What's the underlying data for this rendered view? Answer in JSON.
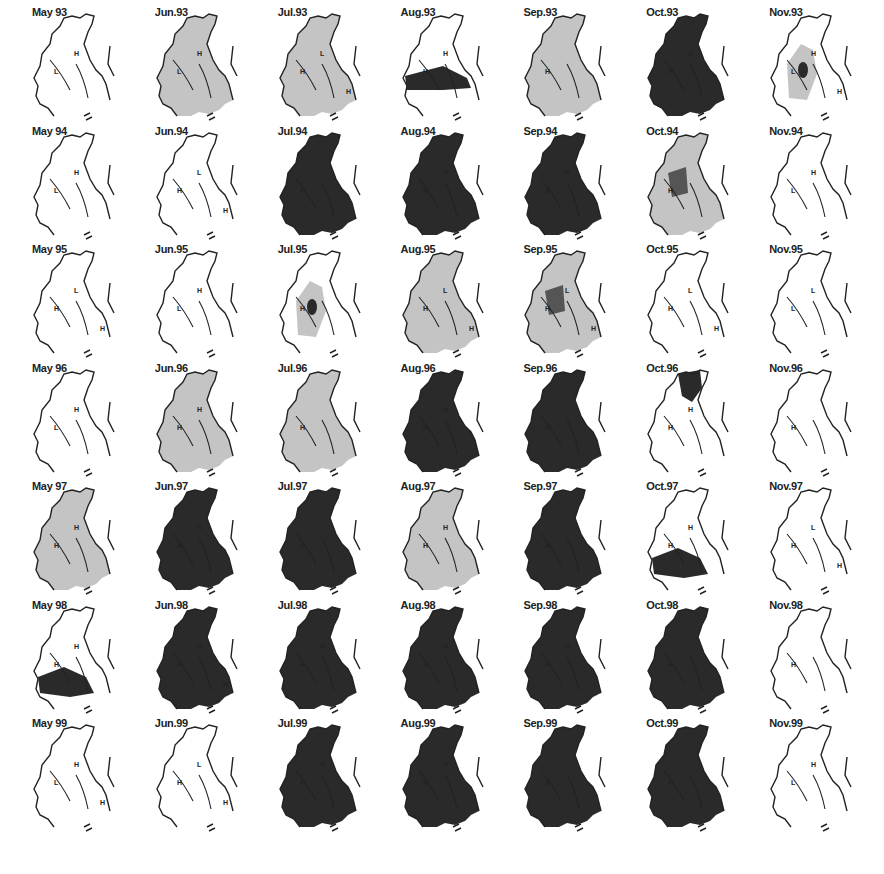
{
  "figure": {
    "rows": [
      "1993",
      "1994",
      "1995",
      "1996",
      "1997",
      "1998",
      "1999"
    ],
    "columns": [
      "May",
      "Jun",
      "Jul",
      "Aug",
      "Sep",
      "Oct",
      "Nov"
    ],
    "shade_colors": {
      "none": "#ffffff",
      "light": "#c4c4c4",
      "medium": "#9a9a9a",
      "dark": "#2a2a2a"
    },
    "panels": [
      {
        "label": "May 93",
        "shade": "none",
        "marks": [
          "L",
          "H"
        ]
      },
      {
        "label": "Jun.93",
        "shade": "light",
        "marks": [
          "L",
          "H"
        ]
      },
      {
        "label": "Jul.93",
        "shade": "light",
        "marks": [
          "H",
          "L",
          "H"
        ]
      },
      {
        "label": "Aug.93",
        "shade": "band",
        "marks": [
          "H",
          "H"
        ]
      },
      {
        "label": "Sep.93",
        "shade": "light",
        "marks": [
          "H"
        ]
      },
      {
        "label": "Oct.93",
        "shade": "dark",
        "marks": [
          "H",
          "H"
        ]
      },
      {
        "label": "Nov.93",
        "shade": "lightspot",
        "marks": [
          "L",
          "H",
          "H"
        ]
      },
      {
        "label": "May 94",
        "shade": "none",
        "marks": [
          "L",
          "H"
        ]
      },
      {
        "label": "Jun.94",
        "shade": "none",
        "marks": [
          "H",
          "L",
          "H"
        ]
      },
      {
        "label": "Jul.94",
        "shade": "dark",
        "marks": [
          "H"
        ]
      },
      {
        "label": "Aug.94",
        "shade": "dark",
        "marks": [
          "H",
          "H"
        ]
      },
      {
        "label": "Sep.94",
        "shade": "dark",
        "marks": [
          "H",
          "H"
        ]
      },
      {
        "label": "Oct.94",
        "shade": "light",
        "marks": [
          "H"
        ]
      },
      {
        "label": "Nov.94",
        "shade": "none",
        "marks": [
          "L",
          "H"
        ]
      },
      {
        "label": "May 95",
        "shade": "none",
        "marks": [
          "H",
          "L",
          "H"
        ]
      },
      {
        "label": "Jun.95",
        "shade": "none",
        "marks": [
          "L",
          "H"
        ]
      },
      {
        "label": "Jul.95",
        "shade": "lightspot",
        "marks": [
          "H"
        ]
      },
      {
        "label": "Aug.95",
        "shade": "light",
        "marks": [
          "H",
          "L",
          "H"
        ]
      },
      {
        "label": "Sep.95",
        "shade": "light",
        "marks": [
          "H",
          "L",
          "H"
        ]
      },
      {
        "label": "Oct.95",
        "shade": "none",
        "marks": [
          "H",
          "L",
          "H"
        ]
      },
      {
        "label": "Nov.95",
        "shade": "none",
        "marks": [
          "L",
          "L"
        ]
      },
      {
        "label": "May 96",
        "shade": "none",
        "marks": [
          "L",
          "H"
        ]
      },
      {
        "label": "Jun.96",
        "shade": "light",
        "marks": [
          "H",
          "H"
        ]
      },
      {
        "label": "Jul.96",
        "shade": "light",
        "marks": [
          "H"
        ]
      },
      {
        "label": "Aug.96",
        "shade": "dark",
        "marks": [
          "H",
          "H"
        ]
      },
      {
        "label": "Sep.96",
        "shade": "dark",
        "marks": [
          "H"
        ]
      },
      {
        "label": "Oct.96",
        "shade": "darktop",
        "marks": [
          "H",
          "H"
        ]
      },
      {
        "label": "Nov.96",
        "shade": "none",
        "marks": [
          "H"
        ]
      },
      {
        "label": "May 97",
        "shade": "light",
        "marks": [
          "H",
          "H"
        ]
      },
      {
        "label": "Jun.97",
        "shade": "dark",
        "marks": [
          "H",
          "H"
        ]
      },
      {
        "label": "Jul.97",
        "shade": "dark",
        "marks": [
          "H"
        ]
      },
      {
        "label": "Aug.97",
        "shade": "light",
        "marks": [
          "H",
          "H"
        ]
      },
      {
        "label": "Sep.97",
        "shade": "dark",
        "marks": [
          "H"
        ]
      },
      {
        "label": "Oct.97",
        "shade": "darkbottom",
        "marks": [
          "H",
          "H"
        ]
      },
      {
        "label": "Nov.97",
        "shade": "none",
        "marks": [
          "H",
          "L",
          "H"
        ]
      },
      {
        "label": "May 98",
        "shade": "darkbottom",
        "marks": [
          "H",
          "H"
        ]
      },
      {
        "label": "Jun.98",
        "shade": "dark",
        "marks": [
          "H",
          "H",
          "H"
        ]
      },
      {
        "label": "Jul.98",
        "shade": "dark",
        "marks": [
          "H",
          "H"
        ]
      },
      {
        "label": "Aug.98",
        "shade": "dark",
        "marks": [
          "H",
          "H"
        ]
      },
      {
        "label": "Sep.98",
        "shade": "dark",
        "marks": [
          "H",
          "H"
        ]
      },
      {
        "label": "Oct.98",
        "shade": "dark",
        "marks": [
          "H"
        ]
      },
      {
        "label": "Nov.98",
        "shade": "none",
        "marks": [
          "H"
        ]
      },
      {
        "label": "May 99",
        "shade": "none",
        "marks": [
          "L",
          "H",
          "H"
        ]
      },
      {
        "label": "Jun.99",
        "shade": "none",
        "marks": [
          "H",
          "L",
          "H"
        ]
      },
      {
        "label": "Jul.99",
        "shade": "dark",
        "marks": [
          "H",
          "H"
        ]
      },
      {
        "label": "Aug.99",
        "shade": "dark",
        "marks": [
          "H",
          "H"
        ]
      },
      {
        "label": "Sep.99",
        "shade": "dark",
        "marks": [
          "H"
        ]
      },
      {
        "label": "Oct.99",
        "shade": "dark",
        "marks": [
          "H"
        ]
      },
      {
        "label": "Nov.99",
        "shade": "none",
        "marks": [
          "L",
          "H"
        ]
      }
    ]
  }
}
